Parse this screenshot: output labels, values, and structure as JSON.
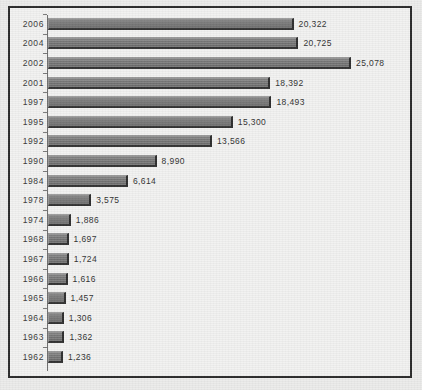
{
  "chart_data": {
    "type": "bar",
    "orientation": "horizontal",
    "title": "",
    "xlabel": "",
    "ylabel": "",
    "grid": false,
    "legend": false,
    "xlim": [
      0,
      25078
    ],
    "categories": [
      "2006",
      "2004",
      "2002",
      "2001",
      "1997",
      "1995",
      "1992",
      "1990",
      "1984",
      "1978",
      "1974",
      "1968",
      "1967",
      "1966",
      "1965",
      "1964",
      "1963",
      "1962"
    ],
    "values": [
      20322,
      20725,
      25078,
      18392,
      18493,
      15300,
      13566,
      8990,
      6614,
      3575,
      1886,
      1697,
      1724,
      1616,
      1457,
      1306,
      1362,
      1236
    ],
    "value_labels": [
      "20,322",
      "20,725",
      "25,078",
      "18,392",
      "18,493",
      "15,300",
      "13,566",
      "8,990",
      "6,614",
      "3,575",
      "1,886",
      "1,697",
      "1,724",
      "1,616",
      "1,457",
      "1,306",
      "1,362",
      "1,236"
    ],
    "bar_color": "#7a7a7a",
    "bar_shadow_color": "#2e2e2e",
    "axis_color": "#6d6d6d",
    "frame_color": "#2c2c2c",
    "label_color": "#333333"
  },
  "caption": ""
}
